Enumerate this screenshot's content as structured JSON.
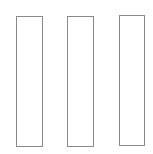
{
  "canvas": {
    "width": 153,
    "height": 154,
    "background": "#ffffff"
  },
  "shapes": [
    {
      "type": "rectangle",
      "x": 16,
      "y": 16,
      "width": 27,
      "height": 131,
      "stroke": "#8a8a8a",
      "fill": "#ffffff"
    },
    {
      "type": "rectangle",
      "x": 67,
      "y": 16,
      "width": 27,
      "height": 131,
      "stroke": "#8a8a8a",
      "fill": "#ffffff"
    },
    {
      "type": "rectangle",
      "x": 119,
      "y": 15,
      "width": 26,
      "height": 131,
      "stroke": "#8a8a8a",
      "fill": "#ffffff"
    }
  ]
}
